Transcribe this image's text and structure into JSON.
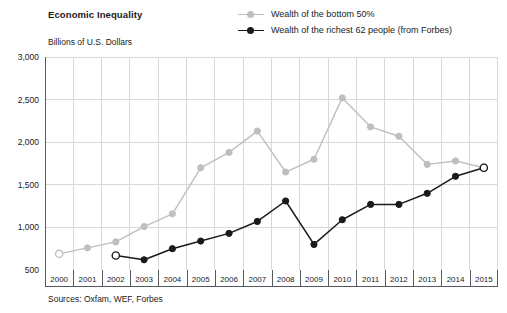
{
  "chart": {
    "title": "Economic Inequality",
    "y_axis_title": "Billions of U.S. Dollars",
    "sources": "Sources: Oxfam, WEF, Forbes"
  },
  "legend": {
    "position": "top-right",
    "items": [
      {
        "label": "Wealth of the bottom 50%",
        "color": "#bfbfbf",
        "marker": "circle-filled"
      },
      {
        "label": "Wealth of the richest 62 people (from Forbes)",
        "color": "#1a1a1a",
        "marker": "circle-filled"
      }
    ]
  },
  "chart_data": {
    "type": "line",
    "title": "Economic Inequality",
    "subtitle": "",
    "xlabel": "",
    "ylabel": "Billions of U.S. Dollars",
    "categories": [
      "2000",
      "2001",
      "2002",
      "2003",
      "2004",
      "2005",
      "2006",
      "2007",
      "2008",
      "2009",
      "2010",
      "2011",
      "2012",
      "2013",
      "2014",
      "2015"
    ],
    "x": [
      2000,
      2001,
      2002,
      2003,
      2004,
      2005,
      2006,
      2007,
      2008,
      2009,
      2010,
      2011,
      2012,
      2013,
      2014,
      2015
    ],
    "ylim": [
      500,
      3000
    ],
    "yticks": [
      500,
      1000,
      1500,
      2000,
      2500,
      3000
    ],
    "ytick_labels": [
      "500",
      "1,000",
      "1,500",
      "2,000",
      "2,500",
      "3,000"
    ],
    "grid": true,
    "legend_position": "top-right",
    "series": [
      {
        "name": "Wealth of the bottom 50%",
        "color": "#bfbfbf",
        "values": [
          690,
          760,
          830,
          1010,
          1160,
          1700,
          1880,
          2130,
          1650,
          1800,
          2520,
          2180,
          2070,
          1740,
          1780,
          1700
        ],
        "open_markers": [
          "2000",
          "2015"
        ]
      },
      {
        "name": "Wealth of the richest 62 people (from Forbes)",
        "color": "#1a1a1a",
        "values": [
          null,
          null,
          670,
          620,
          750,
          840,
          930,
          1070,
          1310,
          800,
          1090,
          1270,
          1270,
          1400,
          1600,
          1700
        ],
        "open_markers": [
          "2002",
          "2015"
        ]
      }
    ]
  }
}
